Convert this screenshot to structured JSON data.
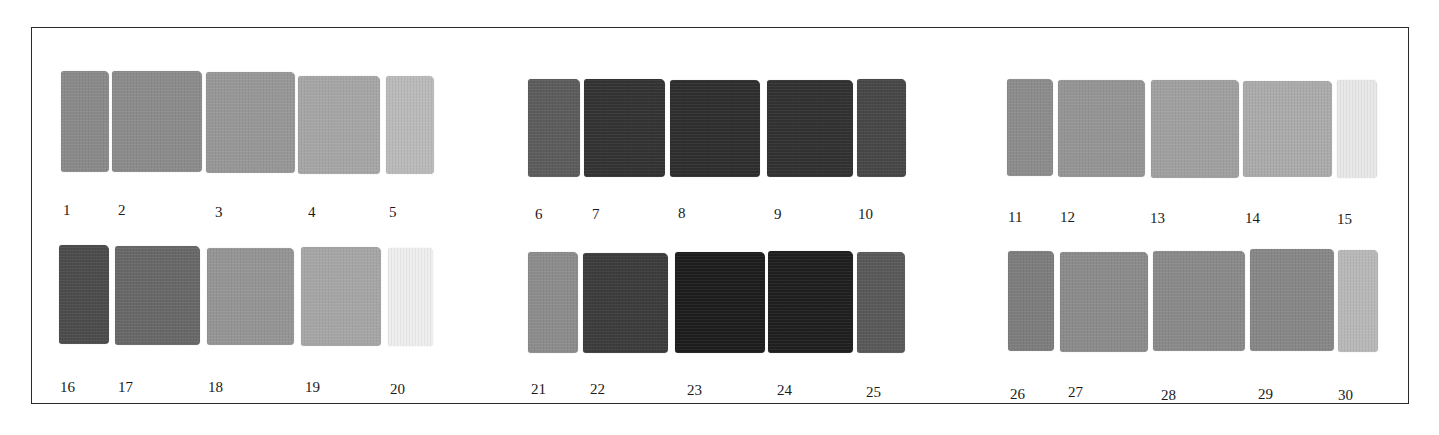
{
  "chart_data": {
    "type": "table",
    "title": "",
    "groups": [
      {
        "row": 1,
        "numbers": [
          1,
          2,
          3,
          4,
          5
        ]
      },
      {
        "row": 1,
        "numbers": [
          6,
          7,
          8,
          9,
          10
        ]
      },
      {
        "row": 1,
        "numbers": [
          11,
          12,
          13,
          14,
          15
        ]
      },
      {
        "row": 2,
        "numbers": [
          16,
          17,
          18,
          19,
          20
        ]
      },
      {
        "row": 2,
        "numbers": [
          21,
          22,
          23,
          24,
          25
        ]
      },
      {
        "row": 2,
        "numbers": [
          26,
          27,
          28,
          29,
          30
        ]
      }
    ]
  },
  "frame": {
    "border_color": "#2a2a2a"
  },
  "swatches": [
    {
      "label": "1",
      "color": "#8a8a8a",
      "x": 61,
      "y": 71,
      "w": 48,
      "h": 101,
      "lx": 63,
      "ly": 203
    },
    {
      "label": "2",
      "color": "#8b8b8b",
      "x": 112,
      "y": 71,
      "w": 90,
      "h": 101,
      "lx": 118,
      "ly": 203
    },
    {
      "label": "3",
      "color": "#979797",
      "x": 206,
      "y": 72,
      "w": 89,
      "h": 101,
      "lx": 215,
      "ly": 205
    },
    {
      "label": "4",
      "color": "#a6a6a6",
      "x": 298,
      "y": 76,
      "w": 82,
      "h": 98,
      "lx": 308,
      "ly": 205
    },
    {
      "label": "5",
      "color": "#bababa",
      "x": 386,
      "y": 76,
      "w": 48,
      "h": 98,
      "lx": 389,
      "ly": 205
    },
    {
      "label": "6",
      "color": "#5c5c5c",
      "x": 528,
      "y": 79,
      "w": 52,
      "h": 98,
      "lx": 535,
      "ly": 207
    },
    {
      "label": "7",
      "color": "#333333",
      "x": 584,
      "y": 79,
      "w": 81,
      "h": 98,
      "lx": 592,
      "ly": 207
    },
    {
      "label": "8",
      "color": "#2e2e2e",
      "x": 670,
      "y": 80,
      "w": 90,
      "h": 97,
      "lx": 678,
      "ly": 206
    },
    {
      "label": "9",
      "color": "#313131",
      "x": 767,
      "y": 80,
      "w": 86,
      "h": 97,
      "lx": 774,
      "ly": 207
    },
    {
      "label": "10",
      "color": "#474747",
      "x": 857,
      "y": 79,
      "w": 49,
      "h": 98,
      "lx": 858,
      "ly": 207
    },
    {
      "label": "11",
      "color": "#8c8c8c",
      "x": 1007,
      "y": 79,
      "w": 46,
      "h": 97,
      "lx": 1008,
      "ly": 210
    },
    {
      "label": "12",
      "color": "#959595",
      "x": 1058,
      "y": 80,
      "w": 87,
      "h": 97,
      "lx": 1060,
      "ly": 210
    },
    {
      "label": "13",
      "color": "#a0a0a0",
      "x": 1151,
      "y": 80,
      "w": 88,
      "h": 98,
      "lx": 1150,
      "ly": 211
    },
    {
      "label": "14",
      "color": "#ababab",
      "x": 1243,
      "y": 81,
      "w": 89,
      "h": 96,
      "lx": 1245,
      "ly": 211
    },
    {
      "label": "15",
      "color": "#e8e8e8",
      "x": 1337,
      "y": 80,
      "w": 40,
      "h": 98,
      "lx": 1337,
      "ly": 212
    },
    {
      "label": "16",
      "color": "#4c4c4c",
      "x": 59,
      "y": 245,
      "w": 50,
      "h": 99,
      "lx": 60,
      "ly": 380
    },
    {
      "label": "17",
      "color": "#686868",
      "x": 115,
      "y": 246,
      "w": 85,
      "h": 99,
      "lx": 118,
      "ly": 380
    },
    {
      "label": "18",
      "color": "#959595",
      "x": 207,
      "y": 248,
      "w": 87,
      "h": 97,
      "lx": 208,
      "ly": 380
    },
    {
      "label": "19",
      "color": "#a6a6a6",
      "x": 301,
      "y": 247,
      "w": 80,
      "h": 99,
      "lx": 305,
      "ly": 380
    },
    {
      "label": "20",
      "color": "#eeeeee",
      "x": 388,
      "y": 248,
      "w": 45,
      "h": 98,
      "lx": 390,
      "ly": 382
    },
    {
      "label": "21",
      "color": "#8c8c8c",
      "x": 528,
      "y": 252,
      "w": 50,
      "h": 101,
      "lx": 531,
      "ly": 382
    },
    {
      "label": "22",
      "color": "#3c3c3c",
      "x": 583,
      "y": 253,
      "w": 85,
      "h": 100,
      "lx": 590,
      "ly": 382
    },
    {
      "label": "23",
      "color": "#1d1d1d",
      "x": 675,
      "y": 252,
      "w": 90,
      "h": 101,
      "lx": 687,
      "ly": 383
    },
    {
      "label": "24",
      "color": "#1f1f1f",
      "x": 768,
      "y": 251,
      "w": 85,
      "h": 102,
      "lx": 777,
      "ly": 383
    },
    {
      "label": "25",
      "color": "#595959",
      "x": 857,
      "y": 252,
      "w": 48,
      "h": 101,
      "lx": 866,
      "ly": 385
    },
    {
      "label": "26",
      "color": "#7d7d7d",
      "x": 1008,
      "y": 251,
      "w": 46,
      "h": 100,
      "lx": 1010,
      "ly": 387
    },
    {
      "label": "27",
      "color": "#8b8b8b",
      "x": 1060,
      "y": 252,
      "w": 88,
      "h": 100,
      "lx": 1068,
      "ly": 385
    },
    {
      "label": "28",
      "color": "#8a8a8a",
      "x": 1153,
      "y": 251,
      "w": 92,
      "h": 100,
      "lx": 1161,
      "ly": 388
    },
    {
      "label": "29",
      "color": "#878787",
      "x": 1250,
      "y": 249,
      "w": 84,
      "h": 102,
      "lx": 1258,
      "ly": 387
    },
    {
      "label": "30",
      "color": "#b8b8b8",
      "x": 1338,
      "y": 250,
      "w": 40,
      "h": 102,
      "lx": 1338,
      "ly": 388
    }
  ]
}
